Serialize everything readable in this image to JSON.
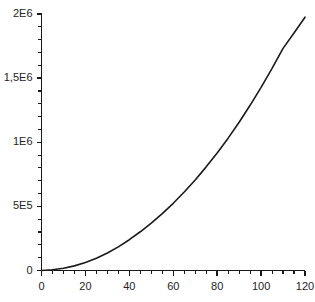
{
  "chart_data": {
    "type": "line",
    "title": "",
    "subtitle": "",
    "xlabel": "",
    "ylabel": "",
    "xlim": [
      0,
      120
    ],
    "ylim": [
      0,
      2000000
    ],
    "grid": false,
    "legend": null,
    "legend_position": "none",
    "background_color": "#ffffff",
    "axis_color": "#1a1a1a",
    "line_color": "#1a1a1a",
    "line_width": 1.6,
    "x_tick_labels": [
      "0",
      "20",
      "40",
      "60",
      "80",
      "100",
      "120"
    ],
    "x_tick_values": [
      0,
      20,
      40,
      60,
      80,
      100,
      120
    ],
    "x_minor_tick_step": 5,
    "y_tick_labels": [
      "0",
      "5E5",
      "1E6",
      "1,5E6",
      "2E6"
    ],
    "y_tick_values": [
      0,
      500000,
      1000000,
      1500000,
      2000000
    ],
    "y_minor_tick_step": 100000,
    "series": [
      {
        "name": "curve",
        "x": [
          0,
          5,
          10,
          15,
          20,
          25,
          30,
          35,
          40,
          45,
          50,
          55,
          60,
          65,
          70,
          75,
          80,
          85,
          90,
          95,
          100,
          105,
          110,
          115,
          120
        ],
        "values": [
          0,
          6000,
          18000,
          36000,
          62000,
          95000,
          136000,
          184000,
          240000,
          302000,
          370000,
          444000,
          524000,
          612000,
          706000,
          808000,
          916000,
          1032000,
          1156000,
          1288000,
          1428000,
          1576000,
          1732000,
          1852000,
          1975000
        ]
      }
    ]
  }
}
